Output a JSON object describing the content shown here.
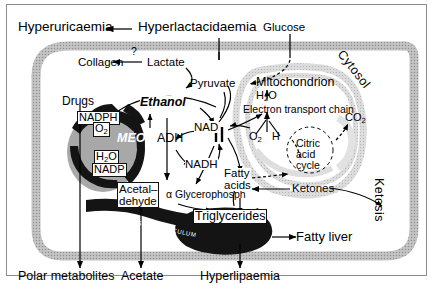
{
  "figure": {
    "colors": {
      "membrane": "#b9b9b9",
      "mitochondrion": "#d8d8d8",
      "organelle_dark": "#141414",
      "stroke": "#000000",
      "frame": "#8c8c8c",
      "background": "#ffffff"
    }
  },
  "extracellular": {
    "hyperuricaemia": "Hyperuricaemia",
    "hyperlactacidaemia": "Hyperlactacidaemia",
    "glucose": "Glucose",
    "polar_metabolites": "Polar metabolites",
    "acetate": "Acetate",
    "hyperlipaemia": "Hyperlipaemia",
    "ketosis": "Ketosis",
    "fatty_liver": "Fatty liver"
  },
  "compartments": {
    "cytosol": "Cytosol",
    "mitochondrion": "Mitochondrion",
    "endoplasmic_reticulum": "ENDOPLASMIC  RETICULUM"
  },
  "cytosol_metabolites": {
    "collagen": "Collagen",
    "lactate": "Lactate",
    "pyruvate": "Pyruvate",
    "unknown_step": "?",
    "drugs": "Drugs",
    "ethanol": "Ethanol",
    "meos": "MEOS",
    "adh": "ADH",
    "nadph": "NADPH",
    "o2_meos": "O2",
    "h2o_meos": "H2O",
    "nadp": "NADP",
    "nad": "NAD",
    "nadh": "NADH",
    "acetaldehyde_line1": "Acetal–",
    "acetaldehyde_line2": "dehyde",
    "alpha_glycerophosphate": "α Glycerophosph",
    "fatty_acids_line1": "Fatty",
    "fatty_acids_line2": "acids",
    "triglycerides": "Triglycerides",
    "ketones": "Ketones"
  },
  "mitochondrial_metabolites": {
    "h2o": "H2O",
    "electron_transport_chain": "Electron transport chain",
    "o2": "O2",
    "h": "H",
    "citric_acid_cycle_line1": "Citric",
    "citric_acid_cycle_line2": "acid",
    "citric_acid_cycle_line3": "cycle",
    "co2": "CO2"
  }
}
